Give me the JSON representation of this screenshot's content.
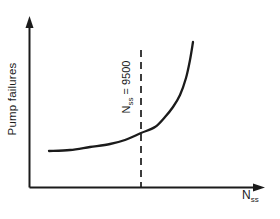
{
  "figure": {
    "y_axis_label": "Pump failures",
    "x_axis_label": {
      "base": "N",
      "sub": "ss"
    },
    "threshold_label": {
      "base": "N",
      "sub": "ss",
      "eq_value": " = 9500"
    }
  },
  "colors": {
    "ink": "#1b1b1b",
    "background": "#ffffff"
  },
  "chart_data": {
    "type": "line",
    "title": "",
    "xlabel": "Nss",
    "ylabel": "Pump failures",
    "x_axis_numeric": false,
    "y_axis_numeric": false,
    "grid": false,
    "legend": false,
    "series": [
      {
        "name": "pump-failures-vs-nss",
        "points_px": [
          [
            49,
            151
          ],
          [
            70,
            150
          ],
          [
            90,
            147
          ],
          [
            110,
            144
          ],
          [
            125,
            140
          ],
          [
            141,
            133
          ],
          [
            155,
            127
          ],
          [
            165,
            117
          ],
          [
            173,
            107
          ],
          [
            180,
            95
          ],
          [
            186,
            78
          ],
          [
            190,
            60
          ],
          [
            193,
            42
          ]
        ]
      }
    ],
    "annotations": [
      {
        "type": "vline-dashed",
        "label": "Nss = 9500",
        "x_px": 141,
        "y_top_px": 50,
        "y_bottom_px": 187
      }
    ],
    "axes_px": {
      "origin": [
        29.5,
        187.5
      ],
      "x_end": [
        265,
        187.5
      ],
      "y_end": [
        29.5,
        16
      ]
    }
  }
}
